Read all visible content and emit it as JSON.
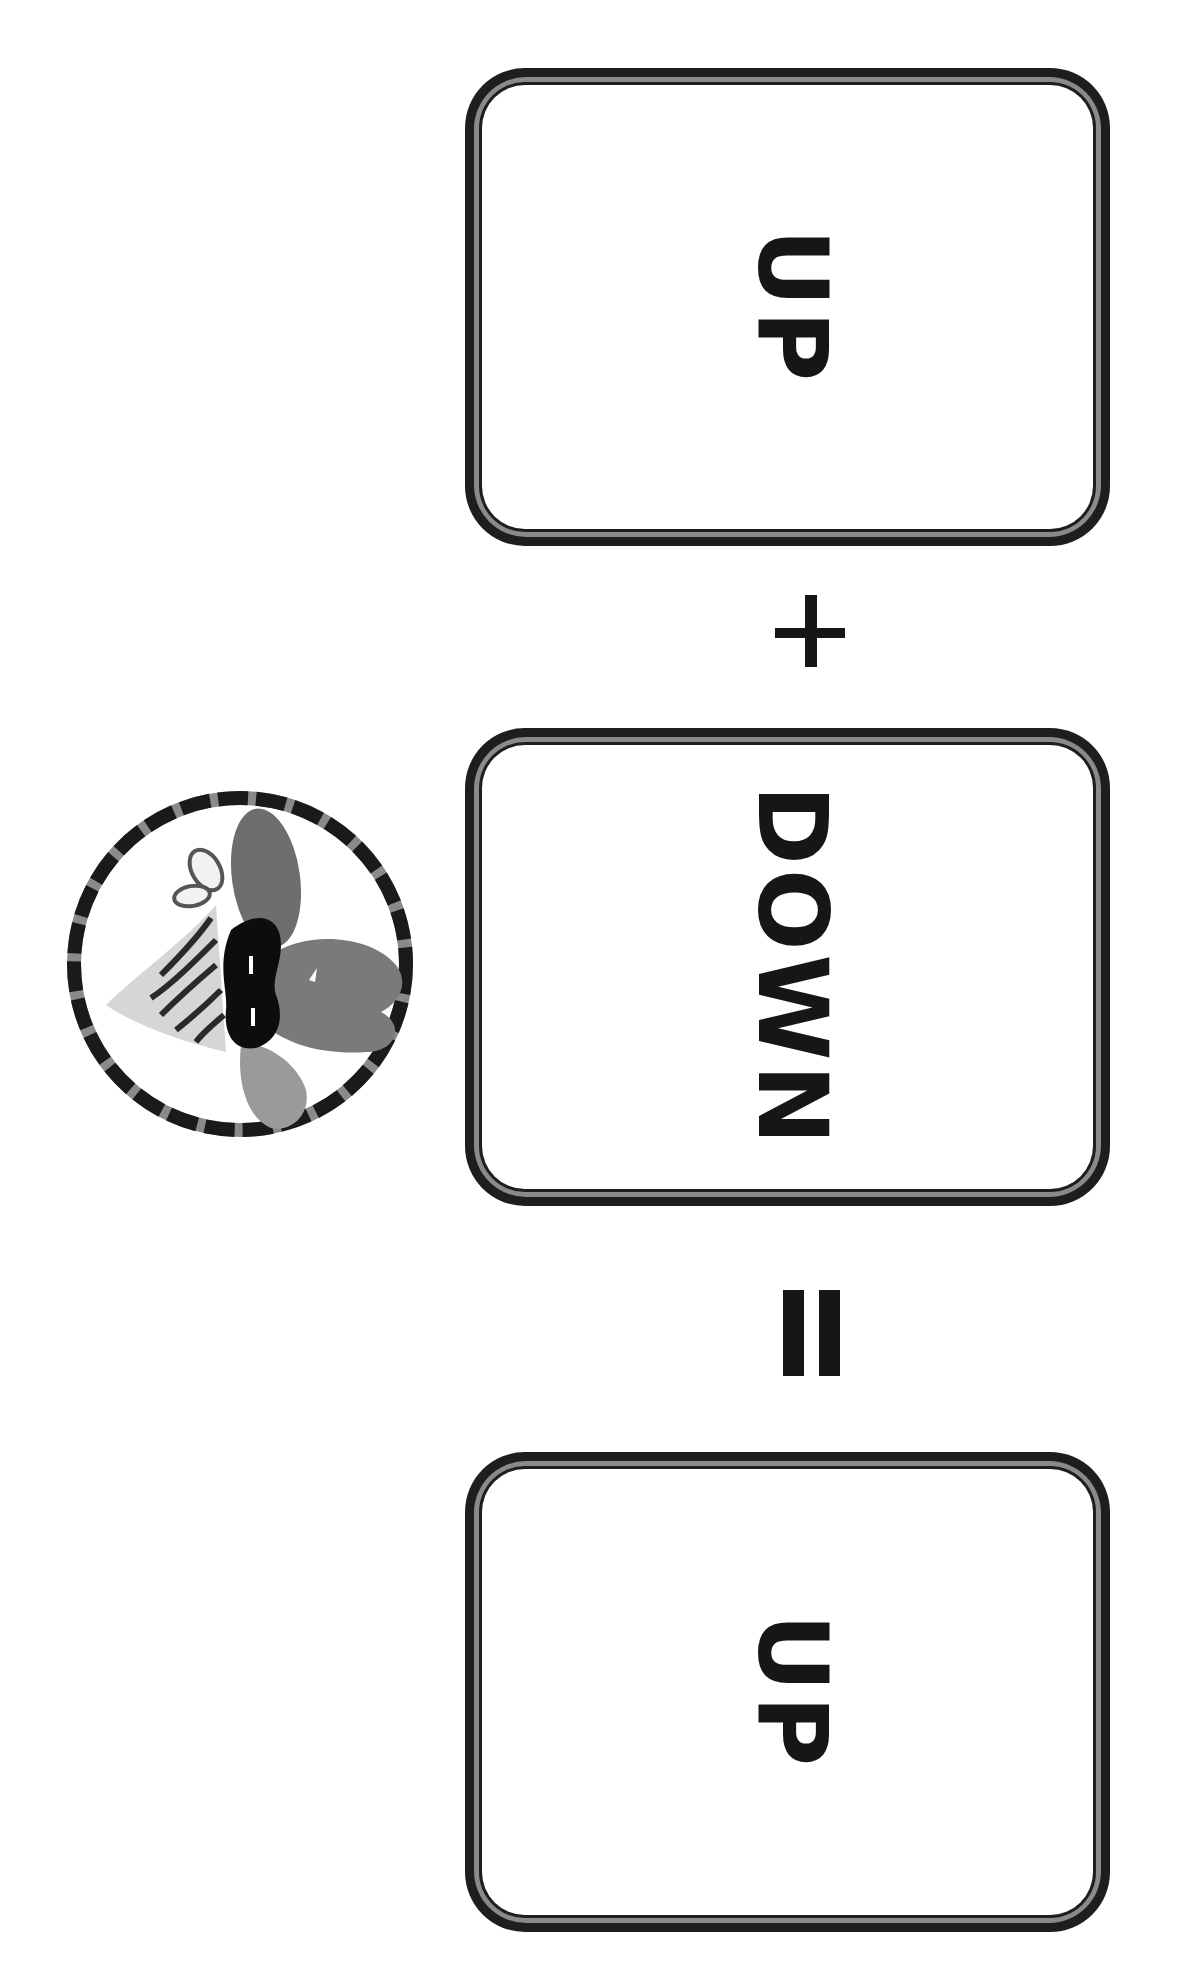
{
  "worksheet": {
    "orientation": "rotated-90-clockwise",
    "equation": {
      "terms": [
        {
          "label": "UP"
        },
        {
          "label": "DOWN"
        }
      ],
      "operator": "+",
      "equals": "=",
      "result": {
        "label": "UP"
      }
    },
    "badge": {
      "icon": "masked-character-icon",
      "description": "circular badge with dashed border showing a masked character with striped bandana"
    },
    "colors": {
      "ink": "#161616",
      "card_border_outer": "#1e1e1e",
      "card_border_mid": "#8a8a8a",
      "background": "#ffffff"
    }
  }
}
